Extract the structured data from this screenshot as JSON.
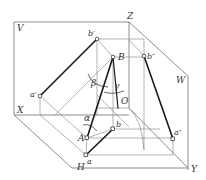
{
  "diagram": {
    "title": "",
    "planes": [
      {
        "id": "V",
        "label": "V"
      },
      {
        "id": "H",
        "label": "H"
      },
      {
        "id": "W",
        "label": "W"
      }
    ],
    "axes": [
      {
        "id": "X",
        "label": "X"
      },
      {
        "id": "Y",
        "label": "Y"
      },
      {
        "id": "Z",
        "label": "Z"
      },
      {
        "id": "O",
        "label": "O"
      }
    ],
    "points": {
      "A": {
        "label": "A",
        "x": 87,
        "y": 138
      },
      "B": {
        "label": "B",
        "x": 113,
        "y": 57
      },
      "a": {
        "label": "a",
        "x": 86,
        "y": 155
      },
      "b": {
        "label": "b",
        "x": 113,
        "y": 129
      },
      "a_prime": {
        "label": "a′",
        "x": 40,
        "y": 96
      },
      "b_prime": {
        "label": "b′",
        "x": 97,
        "y": 39
      },
      "a_dprime": {
        "label": "a″",
        "x": 173,
        "y": 139
      },
      "b_dprime": {
        "label": "b″",
        "x": 144,
        "y": 56
      }
    },
    "angles": [
      {
        "id": "alpha",
        "label": "α"
      },
      {
        "id": "beta",
        "label": "β"
      },
      {
        "id": "gamma",
        "label": "γ"
      }
    ],
    "colors": {
      "frame": "#6e6e6e",
      "line": "#1a1a1a",
      "text": "#333333"
    }
  }
}
